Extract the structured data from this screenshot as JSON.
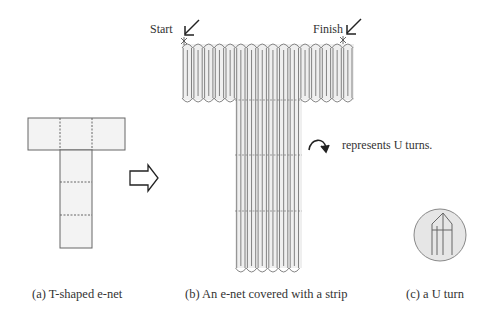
{
  "panel_a": {
    "caption": "(a) T-shaped e-net"
  },
  "panel_b": {
    "caption": "(b) An e-net covered with a strip",
    "start_label": "Start",
    "finish_label": "Finish",
    "legend_text": "represents U turns."
  },
  "panel_c": {
    "caption": "(c) a U turn"
  },
  "colors": {
    "line": "#555555",
    "fill": "#eeeeee",
    "circle_fill": "#e6e6e6"
  }
}
